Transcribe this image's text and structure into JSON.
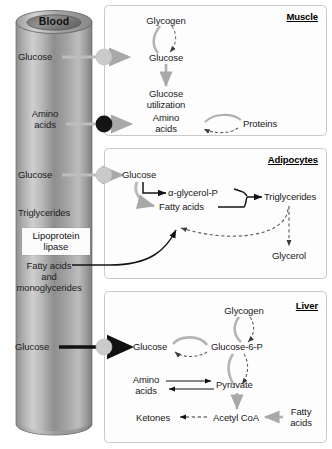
{
  "figure": {
    "type": "metabolic-pathway-diagram",
    "background_color": "#ffffff",
    "vessel": {
      "label": "Blood",
      "labels": [
        {
          "id": "glucose-muscle",
          "text": "Glucose"
        },
        {
          "id": "amino-acids-muscle",
          "text": "Amino\nacids"
        },
        {
          "id": "glucose-adipocyte",
          "text": "Glucose"
        },
        {
          "id": "triglycerides",
          "text": "Triglycerides"
        },
        {
          "id": "fatty-acids-mono",
          "text": "Fatty acids\nand\nmonoglycerides"
        },
        {
          "id": "glucose-liver",
          "text": "Glucose"
        }
      ],
      "enzyme_box": {
        "line1": "Lipoprotein",
        "line2": "lipase"
      },
      "amino_label_line1": "Amino",
      "amino_label_line2": "acids",
      "fatty_line1": "Fatty acids",
      "fatty_line2": "and",
      "fatty_line3": "monoglycerides"
    },
    "panels": [
      {
        "id": "muscle",
        "title": "Muscle",
        "nodes": [
          {
            "id": "glycogen",
            "text": "Glycogen"
          },
          {
            "id": "glucose",
            "text": "Glucose"
          },
          {
            "id": "glucose-utilization-1",
            "text": "Glucose"
          },
          {
            "id": "glucose-utilization-2",
            "text": "utilization"
          },
          {
            "id": "amino-1",
            "text": "Amino"
          },
          {
            "id": "amino-2",
            "text": "acids"
          },
          {
            "id": "proteins",
            "text": "Proteins"
          }
        ]
      },
      {
        "id": "adipocytes",
        "title": "Adipocytes",
        "nodes": [
          {
            "id": "glucose",
            "text": "Glucose"
          },
          {
            "id": "alpha-glycerol-p",
            "text": "α-glycerol-P"
          },
          {
            "id": "fatty-acids",
            "text": "Fatty acids"
          },
          {
            "id": "triglycerides",
            "text": "Triglycerides"
          },
          {
            "id": "glycerol",
            "text": "Glycerol"
          }
        ]
      },
      {
        "id": "liver",
        "title": "Liver",
        "nodes": [
          {
            "id": "glycogen",
            "text": "Glycogen"
          },
          {
            "id": "glucose",
            "text": "Glucose"
          },
          {
            "id": "glucose-6-p",
            "text": "Glucose-6-P"
          },
          {
            "id": "amino-1",
            "text": "Amino"
          },
          {
            "id": "amino-2",
            "text": "acids"
          },
          {
            "id": "pyruvate",
            "text": "Pyruvate"
          },
          {
            "id": "ketones",
            "text": "Ketones"
          },
          {
            "id": "acetyl-coa",
            "text": "Acetyl CoA"
          },
          {
            "id": "fatty-1",
            "text": "Fatty"
          },
          {
            "id": "fatty-2",
            "text": "acids"
          }
        ]
      }
    ],
    "colors": {
      "arrow_gray": "#a8a8a8",
      "arrow_black": "#111111",
      "panel_border": "#c9c9c9",
      "node_open": "#c9c9c9",
      "node_filled": "#1a1a1a",
      "text": "#1a1a1a"
    }
  }
}
